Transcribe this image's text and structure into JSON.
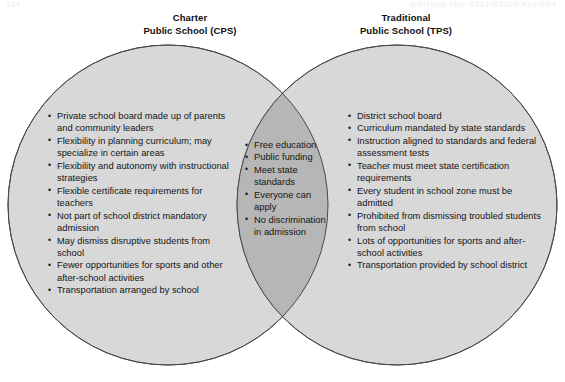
{
  "page": {
    "number": "434",
    "running_head": "WRITING THE STATISTICS REPORT"
  },
  "colors": {
    "circle_fill": "#d8d8d8",
    "overlap_fill": "#b6b6b6",
    "stroke": "#4a4a4a",
    "text": "#141414",
    "background": "#ffffff"
  },
  "diagram": {
    "type": "venn",
    "left": {
      "heading_line1": "Charter",
      "heading_line2": "Public School (CPS)",
      "items": [
        "Private school board made up of parents and community leaders",
        "Flexibility in planning curriculum; may specialize in certain areas",
        "Flexibility and autonomy with instructional strategies",
        "Flexible certificate requirements for teachers",
        "Not part of school district mandatory admission",
        "May dismiss disruptive students from school",
        "Fewer opportunities for sports and other after-school activities",
        "Transportation arranged by school"
      ]
    },
    "right": {
      "heading_line1": "Traditional",
      "heading_line2": "Public School (TPS)",
      "items": [
        "District school board",
        "Curriculum mandated by state standards",
        "Instruction aligned to standards and federal assessment tests",
        "Teacher must meet state certification requirements",
        "Every student in school zone must be admitted",
        "Prohibited from dismissing troubled students from school",
        "Lots of opportunities for sports and after-school activities",
        "Transportation provided by school district"
      ]
    },
    "overlap": {
      "items": [
        "Free education",
        "Public funding",
        "Meet state standards",
        "Everyone can apply",
        "No discrimination in admission"
      ]
    }
  }
}
